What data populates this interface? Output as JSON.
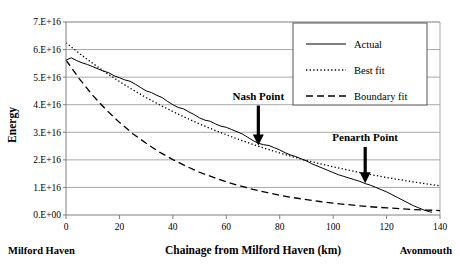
{
  "chart_data": {
    "type": "line",
    "title": "",
    "xlabel": "Chainage from Milford Haven (km)",
    "ylabel": "Energy",
    "xlim": [
      0,
      140
    ],
    "ylim": [
      0,
      7e+16
    ],
    "xticks": [
      0,
      20,
      40,
      60,
      80,
      100,
      120,
      140
    ],
    "xtick_labels": [
      "0",
      "20",
      "40",
      "60",
      "80",
      "100",
      "120",
      "140"
    ],
    "yticks": [
      0,
      1e+16,
      2e+16,
      3e+16,
      4e+16,
      5e+16,
      6e+16,
      7e+16
    ],
    "ytick_labels": [
      "0.E+00",
      "1.E+16",
      "2.E+16",
      "3.E+16",
      "4.E+16",
      "5.E+16",
      "6.E+16",
      "7.E+16"
    ],
    "grid": "horizontal",
    "legend_position": "top-right",
    "axis_endpoint_labels": {
      "left": "Milford Haven",
      "right": "Avonmouth"
    },
    "series": [
      {
        "name": "Actual",
        "style": "solid",
        "color": "#000000",
        "x": [
          0,
          2,
          4,
          6,
          8,
          10,
          12,
          14,
          16,
          18,
          20,
          22,
          24,
          26,
          28,
          30,
          32,
          34,
          36,
          38,
          40,
          42,
          44,
          46,
          48,
          50,
          52,
          54,
          56,
          58,
          60,
          62,
          64,
          66,
          68,
          70,
          72,
          74,
          76,
          78,
          80,
          82,
          84,
          86,
          88,
          90,
          92,
          94,
          96,
          98,
          100,
          102,
          104,
          106,
          108,
          110,
          112,
          114,
          116,
          118,
          120,
          122,
          124,
          126,
          128,
          130,
          132,
          134,
          136,
          137
        ],
        "y": [
          5.62e+16,
          5.7e+16,
          5.6e+16,
          5.52e+16,
          5.46e+16,
          5.38e+16,
          5.3e+16,
          5.22e+16,
          5.16e+16,
          5.05e+16,
          4.98e+16,
          4.9e+16,
          4.85e+16,
          4.74e+16,
          4.62e+16,
          4.5e+16,
          4.44e+16,
          4.34e+16,
          4.26e+16,
          4.12e+16,
          4e+16,
          3.9e+16,
          3.85e+16,
          3.74e+16,
          3.64e+16,
          3.52e+16,
          3.44e+16,
          3.4e+16,
          3.3e+16,
          3.22e+16,
          3.18e+16,
          3.1e+16,
          3.02e+16,
          2.94e+16,
          2.82e+16,
          2.7e+16,
          2.6e+16,
          2.55e+16,
          2.52e+16,
          2.44e+16,
          2.36e+16,
          2.26e+16,
          2.18e+16,
          2.12e+16,
          2.04e+16,
          1.96e+16,
          1.86e+16,
          1.78e+16,
          1.7e+16,
          1.62e+16,
          1.54e+16,
          1.46e+16,
          1.4e+16,
          1.34e+16,
          1.28e+16,
          1.22e+16,
          1.14e+16,
          1.08e+16,
          1e+16,
          9200000000000000.0,
          8400000000000000.0,
          7400000000000000.0,
          6400000000000000.0,
          5400000000000000.0,
          4400000000000000.0,
          3400000000000000.0,
          2600000000000000.0,
          1800000000000000.0,
          1200000000000000.0,
          1000000000000000.0
        ]
      },
      {
        "name": "Best fit",
        "style": "dotted",
        "color": "#000000",
        "x": [
          0,
          5,
          10,
          15,
          20,
          25,
          30,
          35,
          40,
          45,
          50,
          55,
          60,
          65,
          70,
          75,
          80,
          85,
          90,
          95,
          100,
          105,
          110,
          115,
          120,
          125,
          130,
          135,
          140
        ],
        "y": [
          6.25e+16,
          5.86e+16,
          5.5e+16,
          5.16e+16,
          4.84e+16,
          4.54e+16,
          4.26e+16,
          4e+16,
          3.75e+16,
          3.52e+16,
          3.3e+16,
          3.1e+16,
          2.91e+16,
          2.73e+16,
          2.56e+16,
          2.4e+16,
          2.25e+16,
          2.11e+16,
          1.98e+16,
          1.86e+16,
          1.75e+16,
          1.64e+16,
          1.54e+16,
          1.45e+16,
          1.36e+16,
          1.28e+16,
          1.2e+16,
          1.13e+16,
          1.06e+16
        ]
      },
      {
        "name": "Boundary fit",
        "style": "dashed",
        "color": "#000000",
        "x": [
          0,
          5,
          10,
          15,
          20,
          25,
          30,
          35,
          40,
          45,
          50,
          55,
          60,
          65,
          70,
          75,
          80,
          85,
          90,
          95,
          100,
          105,
          110,
          115,
          120,
          125,
          130,
          135,
          140
        ],
        "y": [
          5.62e+16,
          4.94e+16,
          4.34e+16,
          3.82e+16,
          3.36e+16,
          2.95e+16,
          2.6e+16,
          2.28e+16,
          2.01e+16,
          1.77e+16,
          1.55e+16,
          1.37e+16,
          1.2e+16,
          1.06e+16,
          9300000000000000.0,
          8200000000000000.0,
          7200000000000000.0,
          6300000000000000.0,
          5600000000000000.0,
          4900000000000000.0,
          4300000000000000.0,
          3800000000000000.0,
          3300000000000000.0,
          2900000000000000.0,
          2600000000000000.0,
          2300000000000000.0,
          2000000000000000.0,
          1800000000000000.0,
          1600000000000000.0
        ]
      }
    ],
    "annotations": [
      {
        "text": "Nash Point",
        "x": 72,
        "y": 2.52e+16,
        "label_offset_y": 1.45e+16
      },
      {
        "text": "Penarth Point",
        "x": 112,
        "y": 1.15e+16,
        "label_offset_y": 1.32e+16
      }
    ]
  },
  "legend": {
    "entries": [
      {
        "label": "Actual",
        "style": "solid"
      },
      {
        "label": "Best fit",
        "style": "dotted"
      },
      {
        "label": "Boundary fit",
        "style": "dashed"
      }
    ]
  }
}
